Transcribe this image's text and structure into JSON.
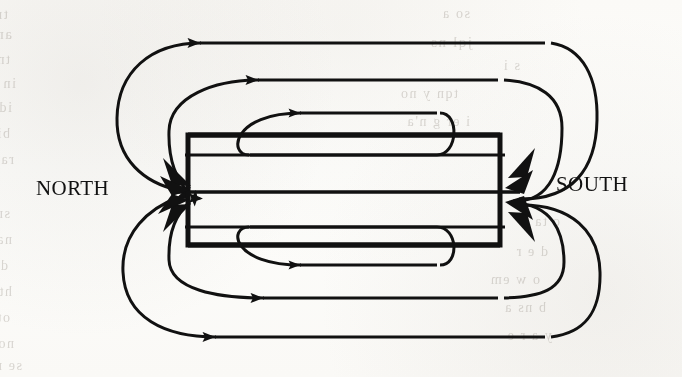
{
  "figure": {
    "background_color": "#fdfcfa",
    "ink_color": "#111111"
  },
  "labels": {
    "north": "NORTH",
    "south": "SOUTH"
  },
  "diagram": {
    "center_box": {
      "name": "central-rectangle",
      "x": 188,
      "y": 135,
      "width": 312,
      "height": 110,
      "stroke_width": 5
    },
    "axis_line_y": 192,
    "loops": [
      {
        "id": "loop-1",
        "side": "outer",
        "top_y": 43,
        "bottom_y": 337,
        "turn_left_x": 120,
        "turn_right_x": 565,
        "arrow_dir": "left"
      },
      {
        "id": "loop-2",
        "side": "mid",
        "top_y": 80,
        "bottom_y": 298,
        "turn_left_x": 168,
        "turn_right_x": 520,
        "arrow_dir": "left"
      },
      {
        "id": "loop-3",
        "side": "inner",
        "top_y": 113,
        "bottom_y": 265,
        "turn_left_x": 240,
        "turn_right_x": 450,
        "arrow_dir": "left"
      }
    ],
    "arrowheads_north": 6,
    "arrowheads_south": 6
  },
  "bleed_through": {
    "visible": true,
    "lines": [
      {
        "text": "tr vj fnn xie ll)d tiv e",
        "x": 8,
        "y": 6,
        "size": 15
      },
      {
        "text": "an r lax enrut bi o f rei",
        "x": 12,
        "y": 26,
        "size": 15
      },
      {
        "text": "tnemg havc nn d curre prt",
        "x": 10,
        "y": 52,
        "size": 14
      },
      {
        "text": "in the ts rol e lentit ra",
        "x": 16,
        "y": 76,
        "size": 14
      },
      {
        "text": "id ul ni poi ot ar t n hese",
        "x": 12,
        "y": 100,
        "size": 14
      },
      {
        "text": "bir t nd ba e h ud y nd pro",
        "x": 10,
        "y": 126,
        "size": 14
      },
      {
        "text": "rae lo hte ggni e lb ma",
        "x": 14,
        "y": 152,
        "size": 14
      },
      {
        "text": "snoi tu rb th l ta ne m",
        "x": 10,
        "y": 206,
        "size": 14
      },
      {
        "text": "nare tl te ed i a m ter",
        "x": 12,
        "y": 232,
        "size": 14
      },
      {
        "text": "dlo e to ar chap t am the LI",
        "x": 8,
        "y": 258,
        "size": 14
      },
      {
        "text": "hte rr sa d tlc em h e ht",
        "x": 12,
        "y": 284,
        "size": 14
      },
      {
        "text": "ot le a cirb f mih a tnes",
        "x": 10,
        "y": 310,
        "size": 14
      },
      {
        "text": "no ei d fo e nivas e rp",
        "x": 14,
        "y": 336,
        "size": 14
      },
      {
        "text": "se mi n ra ht e mos",
        "x": 22,
        "y": 358,
        "size": 14
      },
      {
        "text": "so a",
        "x": 470,
        "y": 6,
        "size": 14
      },
      {
        "text": "jql     ns",
        "x": 472,
        "y": 34,
        "size": 15
      },
      {
        "text": "s    i",
        "x": 520,
        "y": 58,
        "size": 14
      },
      {
        "text": "tqn  y       no",
        "x": 458,
        "y": 86,
        "size": 14
      },
      {
        "text": "i er   g    n'a",
        "x": 470,
        "y": 114,
        "size": 14
      },
      {
        "text": "c ta",
        "x": 560,
        "y": 214,
        "size": 14
      },
      {
        "text": "d e r",
        "x": 548,
        "y": 244,
        "size": 14
      },
      {
        "text": "o w em",
        "x": 540,
        "y": 272,
        "size": 14
      },
      {
        "text": "b ns a",
        "x": 546,
        "y": 300,
        "size": 14
      },
      {
        "text": "y  a r e",
        "x": 552,
        "y": 328,
        "size": 14
      }
    ]
  }
}
